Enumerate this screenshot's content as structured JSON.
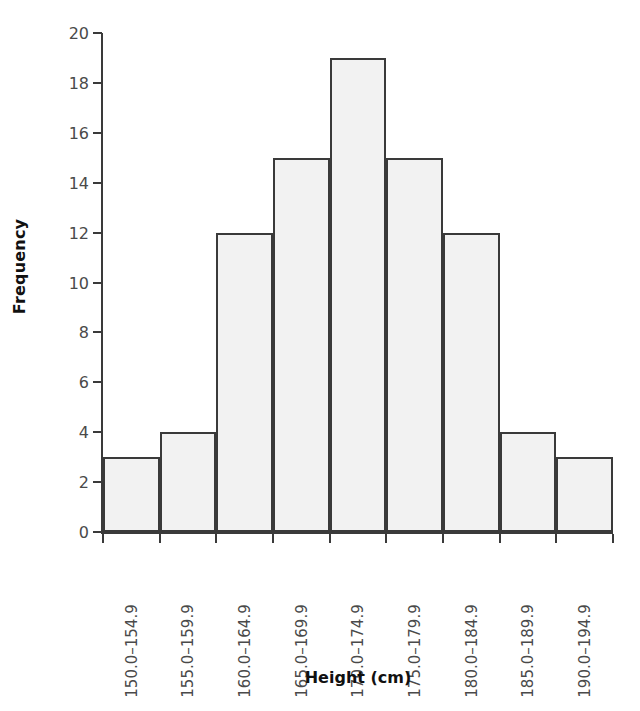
{
  "chart_data": {
    "type": "bar",
    "title": "",
    "subtitle": "",
    "xlabel": "Height (cm)",
    "ylabel": "Frequency",
    "categories": [
      "150.0–154.9",
      "155.0–159.9",
      "160.0–164.9",
      "165.0–169.9",
      "170.0–174.9",
      "175.0–179.9",
      "180.0–184.9",
      "185.0–189.9",
      "190.0–194.9"
    ],
    "values": [
      3,
      4,
      12,
      15,
      19,
      15,
      12,
      4,
      3
    ],
    "ylim": [
      0,
      20
    ],
    "yticks": [
      0,
      2,
      4,
      6,
      8,
      10,
      12,
      14,
      16,
      18,
      20
    ],
    "ytick_labels": [
      "0",
      "2",
      "4",
      "6",
      "8",
      "10",
      "12",
      "14",
      "16",
      "18",
      "20"
    ],
    "grid": false,
    "legend": null,
    "legend_position": "none",
    "bar_fill_color": "#f2f2f2",
    "bar_edge_color": "#3a3a3a",
    "axis_color": "#3a3a3a",
    "tick_label_color": "#4a4a4a",
    "axis_title_color": "#111111",
    "background_color": "#ffffff"
  }
}
